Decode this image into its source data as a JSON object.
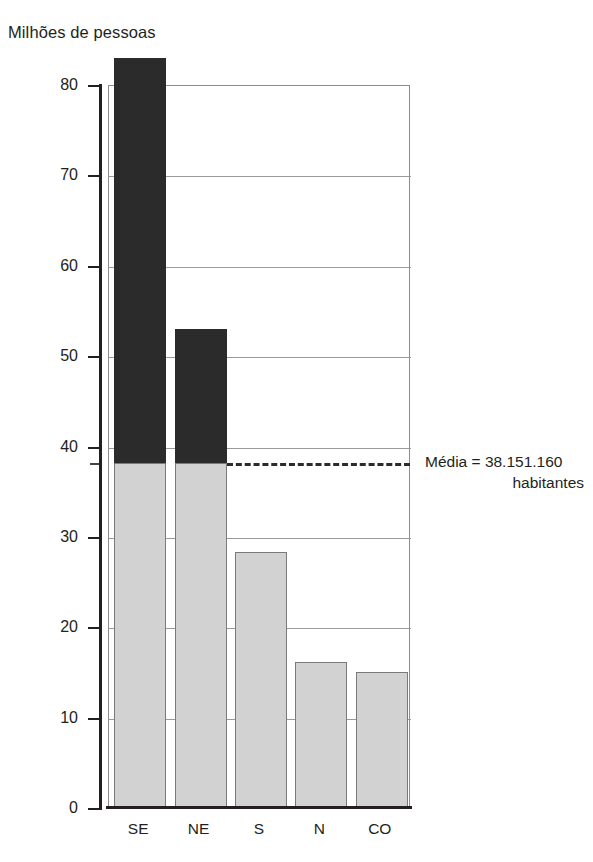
{
  "chart_data": {
    "type": "bar",
    "title": "",
    "ylabel": "Milhões de pessoas",
    "xlabel": "",
    "categories": [
      "SE",
      "NE",
      "S",
      "N",
      "CO"
    ],
    "values": [
      83.0,
      53.0,
      28.3,
      16.2,
      15.0
    ],
    "series": [
      {
        "name": "População por região (milhões de pessoas)",
        "values": [
          83.0,
          53.0,
          28.3,
          16.2,
          15.0
        ]
      }
    ],
    "ylim": [
      0,
      80
    ],
    "ytick_labels": [
      "0",
      "10",
      "20",
      "30",
      "40",
      "50",
      "60",
      "70",
      "80"
    ],
    "ytick_values": [
      0,
      10,
      20,
      30,
      40,
      50,
      60,
      70,
      80
    ],
    "grid": true,
    "legend": "none",
    "reference_line": {
      "label": "Média = 38.151.160 habitantes",
      "value": 38.15116,
      "style": "dashed"
    },
    "segment_colors": {
      "above_mean": "#2b2b2b",
      "below_mean": "#d2d2d2"
    },
    "annotation": {
      "line1": "Média = 38.151.160",
      "line2": "habitantes"
    }
  },
  "axis": {
    "y_title": "Milhões de pessoas",
    "ticks": [
      {
        "label": "80",
        "value": 80
      },
      {
        "label": "70",
        "value": 70
      },
      {
        "label": "60",
        "value": 60
      },
      {
        "label": "50",
        "value": 50
      },
      {
        "label": "40",
        "value": 40
      },
      {
        "label": "30",
        "value": 30
      },
      {
        "label": "20",
        "value": 20
      },
      {
        "label": "10",
        "value": 10
      },
      {
        "label": "0",
        "value": 0
      }
    ]
  },
  "categories": [
    {
      "label": "SE",
      "value": 83.0
    },
    {
      "label": "NE",
      "value": 53.0
    },
    {
      "label": "S",
      "value": 28.3
    },
    {
      "label": "N",
      "value": 16.2
    },
    {
      "label": "CO",
      "value": 15.0
    }
  ],
  "colors": {
    "bar_above_mean": "#2b2b2b",
    "bar_below_mean": "#d2d2d2",
    "bar_stroke": "#7a7a7a",
    "grid": "#9a9a9a",
    "axis": "#231f20",
    "text": "#231f20",
    "background": "#ffffff"
  }
}
